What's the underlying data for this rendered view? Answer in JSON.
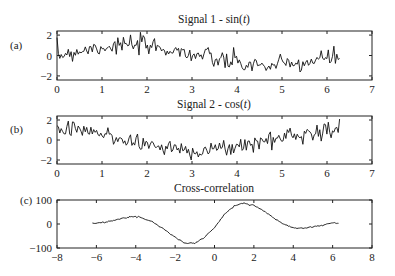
{
  "chart_data": [
    {
      "type": "line",
      "panel_label": "(a)",
      "title": "Signal 1 - sin(t)",
      "xlabel": "",
      "ylabel": "",
      "xlim": [
        0,
        7
      ],
      "ylim": [
        -2.4,
        2.4
      ],
      "xticks": [
        0,
        1,
        2,
        3,
        4,
        5,
        6,
        7
      ],
      "yticks": [
        -2,
        0,
        2
      ],
      "grid": false,
      "series": [
        {
          "name": "sin(t) + noise",
          "description": "noisy sine wave from t=0 to 2π",
          "x_range": [
            0,
            6.28
          ]
        }
      ]
    },
    {
      "type": "line",
      "panel_label": "(b)",
      "title": "Signal 2 - cos(t)",
      "xlabel": "",
      "ylabel": "",
      "xlim": [
        0,
        7
      ],
      "ylim": [
        -2.4,
        2.4
      ],
      "xticks": [
        0,
        1,
        2,
        3,
        4,
        5,
        6,
        7
      ],
      "yticks": [
        -2,
        0,
        2
      ],
      "grid": false,
      "series": [
        {
          "name": "cos(t) + noise",
          "description": "noisy cosine wave from t=0 to 2π",
          "x_range": [
            0,
            6.28
          ]
        }
      ]
    },
    {
      "type": "line",
      "panel_label": "(c)",
      "title": "Cross-correlation",
      "xlabel": "",
      "ylabel": "",
      "xlim": [
        -8,
        8
      ],
      "ylim": [
        -100,
        100
      ],
      "xticks": [
        -8,
        -6,
        -4,
        -2,
        0,
        2,
        4,
        6,
        8
      ],
      "yticks": [
        -100,
        0,
        100
      ],
      "grid": false,
      "series": [
        {
          "name": "cross-correlation",
          "x": [
            -6.2,
            -5.5,
            -5.0,
            -4.5,
            -4.2,
            -3.8,
            -3.2,
            -2.6,
            -2.0,
            -1.5,
            -1.0,
            -0.5,
            0,
            0.5,
            1.0,
            1.5,
            2.0,
            2.5,
            3.0,
            3.5,
            4.0,
            4.5,
            5.0,
            5.5,
            6.0,
            6.3
          ],
          "values": [
            2,
            8,
            18,
            28,
            31,
            28,
            12,
            -20,
            -55,
            -80,
            -80,
            -55,
            -15,
            40,
            75,
            87,
            78,
            55,
            25,
            0,
            -15,
            -17,
            -12,
            -5,
            5,
            3
          ]
        }
      ]
    }
  ],
  "panels": {
    "a": {
      "label": "(a)",
      "title": "Signal 1 - sin(t)",
      "xticks": [
        "0",
        "1",
        "2",
        "3",
        "4",
        "5",
        "6",
        "7"
      ],
      "yticks": [
        "2",
        "0",
        "−2"
      ]
    },
    "b": {
      "label": "(b)",
      "title": "Signal 2 - cos(t)",
      "xticks": [
        "0",
        "1",
        "2",
        "3",
        "4",
        "5",
        "6",
        "7"
      ],
      "yticks": [
        "2",
        "0",
        "−2"
      ]
    },
    "c": {
      "label": "(c)",
      "title": "Cross-correlation",
      "xticks": [
        "−8",
        "−6",
        "−4",
        "−2",
        "0",
        "2",
        "4",
        "6",
        "8"
      ],
      "yticks": [
        "100",
        "0",
        "−100"
      ]
    }
  }
}
